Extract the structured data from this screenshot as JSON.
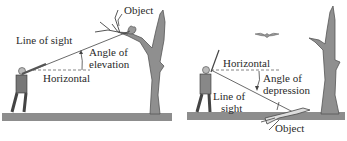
{
  "colors": {
    "ground": "#8d8d8d",
    "tree": "#8f8f8f",
    "tree_dark": "#555555",
    "line": "#444444",
    "dashed": "#666666",
    "text": "#2a2a2a"
  },
  "left_panel": {
    "title": "Angle of elevation scenario",
    "labels": {
      "object": "Object",
      "line_of_sight": "Line of sight",
      "angle_line1": "Angle of",
      "angle_line2": "elevation",
      "horizontal": "Horizontal"
    }
  },
  "right_panel": {
    "title": "Angle of depression scenario",
    "labels": {
      "horizontal": "Horizontal",
      "angle_line1": "Angle of",
      "angle_line2": "depression",
      "line_of_sight_line1": "Line of",
      "line_of_sight_line2": "sight",
      "object": "Object"
    }
  }
}
